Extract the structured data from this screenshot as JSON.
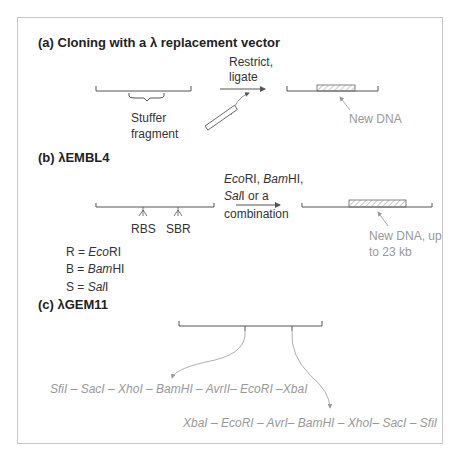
{
  "colors": {
    "line": "#555555",
    "grey": "#999999",
    "frame": "#c8c8c8"
  },
  "panel_a": {
    "heading": "(a) Cloning with a λ replacement vector",
    "stuffer_label_1": "Stuffer",
    "stuffer_label_2": "fragment",
    "arrow_label_1": "Restrict,",
    "arrow_label_2": "ligate",
    "new_dna": "New DNA"
  },
  "panel_b": {
    "heading": "(b) λEMBL4",
    "site_left": "RBS",
    "site_right": "SBR",
    "arrow_line1_it1": "Eco",
    "arrow_line1_t1": "RI, ",
    "arrow_line1_it2": "Bam",
    "arrow_line1_t2": "HI,",
    "arrow_line2_it": "Sal",
    "arrow_line2_t": "I or a",
    "arrow_line3": "combination",
    "new_dna_1": "New DNA, up",
    "new_dna_2": "to 23 kb",
    "legend": [
      {
        "prefix": "R = ",
        "italic": "Eco",
        "suffix": "RI"
      },
      {
        "prefix": "B = ",
        "italic": "Bam",
        "suffix": "HI"
      },
      {
        "prefix": "S = ",
        "italic": "Sal",
        "suffix": "I"
      }
    ]
  },
  "panel_c": {
    "heading": "(c) λGEM11",
    "left_sites": "SfiI – SacI – XhoI – BamHI – AvrII– EcoRI –XbaI",
    "right_sites": "XbaI – EcoRI – AvrI– BamHI – XhoI– SacI – SfiI"
  }
}
